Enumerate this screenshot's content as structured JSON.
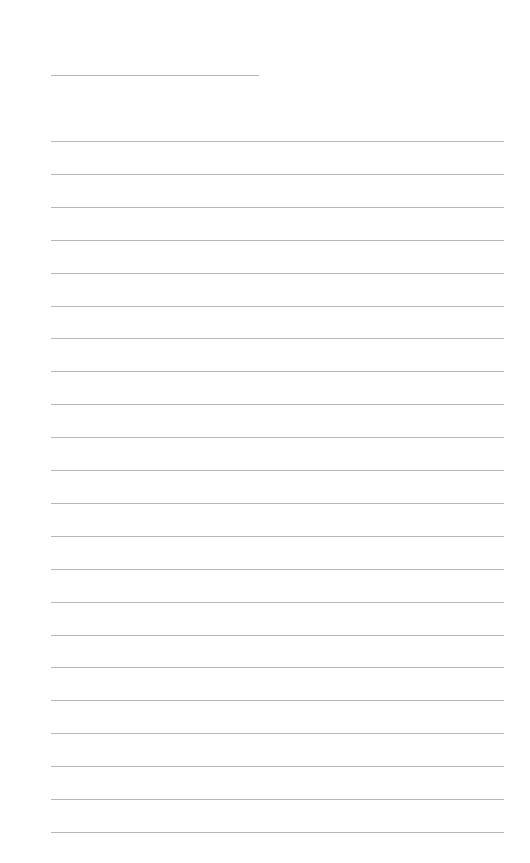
{
  "page": {
    "type": "blank lined paper",
    "background": "#ffffff",
    "line_color": "#b8b8b8",
    "header_line": {
      "x": 51,
      "y": 75,
      "width": 208
    },
    "ruled_lines": {
      "count": 22,
      "x": 51,
      "first_y": 141,
      "spacing": 32.9,
      "width": 453
    }
  }
}
